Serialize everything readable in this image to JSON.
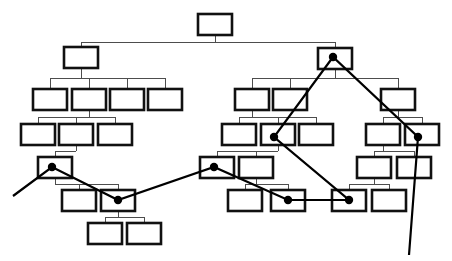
{
  "diagram": {
    "type": "tree-with-path-overlay",
    "canvas": {
      "width": 452,
      "height": 261,
      "background": "#ffffff"
    },
    "style": {
      "node_fill": "#ffffff",
      "node_stroke": "#111111",
      "node_stroke_width": 2.6,
      "edge_stroke": "#4d4d4d",
      "edge_stroke_width": 1,
      "path_stroke": "#000000",
      "path_stroke_width": 2.2,
      "dot_fill": "#000000",
      "dot_radius": 4.2,
      "node_width": 34,
      "node_height": 21
    },
    "nodes": [
      {
        "id": "n0",
        "label": "",
        "x": 198,
        "y": 14
      },
      {
        "id": "n1",
        "label": "",
        "x": 64,
        "y": 47
      },
      {
        "id": "n2",
        "label": "",
        "x": 318,
        "y": 48
      },
      {
        "id": "n3",
        "label": "",
        "x": 33,
        "y": 89
      },
      {
        "id": "n4",
        "label": "",
        "x": 72,
        "y": 89
      },
      {
        "id": "n5",
        "label": "",
        "x": 110,
        "y": 89
      },
      {
        "id": "n6",
        "label": "",
        "x": 148,
        "y": 89
      },
      {
        "id": "n7",
        "label": "",
        "x": 235,
        "y": 89
      },
      {
        "id": "n8",
        "label": "",
        "x": 273,
        "y": 89
      },
      {
        "id": "n9",
        "label": "",
        "x": 381,
        "y": 89
      },
      {
        "id": "n10",
        "label": "",
        "x": 21,
        "y": 124
      },
      {
        "id": "n11",
        "label": "",
        "x": 59,
        "y": 124
      },
      {
        "id": "n12",
        "label": "",
        "x": 98,
        "y": 124
      },
      {
        "id": "n13",
        "label": "",
        "x": 222,
        "y": 124
      },
      {
        "id": "n14",
        "label": "",
        "x": 261,
        "y": 124
      },
      {
        "id": "n15",
        "label": "",
        "x": 299,
        "y": 124
      },
      {
        "id": "n16",
        "label": "",
        "x": 366,
        "y": 124
      },
      {
        "id": "n17",
        "label": "",
        "x": 405,
        "y": 124
      },
      {
        "id": "n18",
        "label": "",
        "x": 38,
        "y": 157
      },
      {
        "id": "n19",
        "label": "",
        "x": 200,
        "y": 157
      },
      {
        "id": "n20",
        "label": "",
        "x": 239,
        "y": 157
      },
      {
        "id": "n21",
        "label": "",
        "x": 357,
        "y": 157
      },
      {
        "id": "n22",
        "label": "",
        "x": 397,
        "y": 157
      },
      {
        "id": "n23",
        "label": "",
        "x": 62,
        "y": 190
      },
      {
        "id": "n24",
        "label": "",
        "x": 101,
        "y": 190
      },
      {
        "id": "n25",
        "label": "",
        "x": 228,
        "y": 190
      },
      {
        "id": "n26",
        "label": "",
        "x": 271,
        "y": 190
      },
      {
        "id": "n27",
        "label": "",
        "x": 332,
        "y": 190
      },
      {
        "id": "n28",
        "label": "",
        "x": 372,
        "y": 190
      },
      {
        "id": "n29",
        "label": "",
        "x": 88,
        "y": 223
      },
      {
        "id": "n30",
        "label": "",
        "x": 127,
        "y": 223
      }
    ],
    "edges": [
      {
        "parent": "n0",
        "children": [
          "n1",
          "n2"
        ],
        "bus_y": 42
      },
      {
        "parent": "n1",
        "children": [
          "n3",
          "n4",
          "n5",
          "n6"
        ],
        "bus_y": 78
      },
      {
        "parent": "n2",
        "children": [
          "n7",
          "n8",
          "n9"
        ],
        "bus_y": 78
      },
      {
        "parent": "n4",
        "children": [
          "n10",
          "n11",
          "n12"
        ],
        "bus_y": 117
      },
      {
        "parent": "n7",
        "children": [
          "n13",
          "n14",
          "n15"
        ],
        "bus_y": 117
      },
      {
        "parent": "n9",
        "children": [
          "n16",
          "n17"
        ],
        "bus_y": 117
      },
      {
        "parent": "n11",
        "children": [
          "n18"
        ],
        "bus_y": 151
      },
      {
        "parent": "n14",
        "children": [
          "n19",
          "n20"
        ],
        "bus_y": 151
      },
      {
        "parent": "n16",
        "children": [
          "n21",
          "n22"
        ],
        "bus_y": 151
      },
      {
        "parent": "n18",
        "children": [
          "n23",
          "n24"
        ],
        "bus_y": 184
      },
      {
        "parent": "n20",
        "children": [
          "n25",
          "n26"
        ],
        "bus_y": 184
      },
      {
        "parent": "n21",
        "children": [
          "n27",
          "n28"
        ],
        "bus_y": 184
      },
      {
        "parent": "n24",
        "children": [
          "n29",
          "n30"
        ],
        "bus_y": 217
      }
    ],
    "path": {
      "name": "traversal-path",
      "points": [
        {
          "x": 13,
          "y": 196,
          "marker": false
        },
        {
          "x": 52,
          "y": 167,
          "marker": true
        },
        {
          "x": 118,
          "y": 200,
          "marker": true
        },
        {
          "x": 214,
          "y": 167,
          "marker": true
        },
        {
          "x": 288,
          "y": 200,
          "marker": true
        },
        {
          "x": 349,
          "y": 200,
          "marker": true
        },
        {
          "x": 274,
          "y": 137,
          "marker": true
        },
        {
          "x": 333,
          "y": 57,
          "marker": true
        },
        {
          "x": 418,
          "y": 137,
          "marker": true
        },
        {
          "x": 409,
          "y": 255,
          "marker": false
        }
      ]
    }
  }
}
